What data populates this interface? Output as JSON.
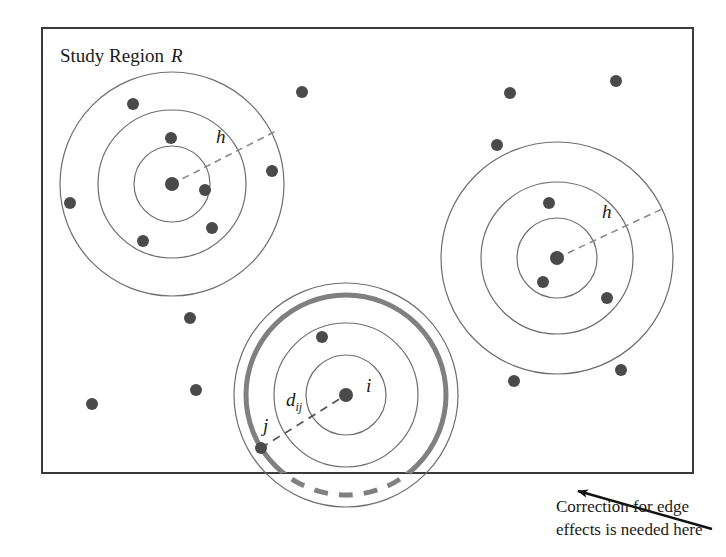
{
  "figure": {
    "width": 726,
    "height": 557,
    "background": "#ffffff",
    "study_region": {
      "label": "Study Region",
      "label_italic": "R",
      "x": 42,
      "y": 28,
      "width": 651,
      "height": 445,
      "stroke": "#3a3a3a"
    },
    "annotation": {
      "line1": "Correction for edge",
      "line2": "effects is needed here",
      "arrow_from_x": 712,
      "arrow_from_y": 529,
      "arrow_to_x": 578,
      "arrow_to_y": 491
    },
    "colors": {
      "point": "#4a4a4a",
      "thin_circle": "#6e6e6e",
      "thick_circle": "#808080",
      "dashed_radius": "#8a8a8a",
      "text": "#1a1a1a",
      "border": "#3a3a3a"
    },
    "clusters": [
      {
        "name": "top-left-cluster",
        "center_x": 172,
        "center_y": 184,
        "radii": [
          38,
          74,
          112
        ],
        "radius_label": "h",
        "radius_label_x": 216,
        "radius_label_y": 143,
        "dashed_angle_deg": -27
      },
      {
        "name": "right-cluster",
        "center_x": 557,
        "center_y": 258,
        "radii": [
          40,
          76,
          116
        ],
        "radius_label": "h",
        "radius_label_x": 602,
        "radius_label_y": 218,
        "dashed_angle_deg": -25
      },
      {
        "name": "bottom-edge-cluster",
        "center_x": 346,
        "center_y": 395,
        "radii": [
          40,
          72,
          112
        ],
        "highlight_radius": 100,
        "center_label": "i",
        "center_label_x": 366,
        "center_label_y": 392,
        "neighbor_label": "j",
        "neighbor_label_x": 263,
        "neighbor_label_y": 432,
        "distance_label": "d",
        "distance_label_sub": "ij",
        "distance_label_x": 286,
        "distance_label_y": 406
      }
    ],
    "points": [
      {
        "x": 172,
        "y": 184,
        "r": 7,
        "name": "point-cluster1-center"
      },
      {
        "x": 133,
        "y": 104,
        "r": 6,
        "name": "point"
      },
      {
        "x": 171,
        "y": 138,
        "r": 6,
        "name": "point"
      },
      {
        "x": 205,
        "y": 190,
        "r": 6,
        "name": "point"
      },
      {
        "x": 70,
        "y": 203,
        "r": 6,
        "name": "point"
      },
      {
        "x": 212,
        "y": 228,
        "r": 6,
        "name": "point"
      },
      {
        "x": 143,
        "y": 241,
        "r": 6,
        "name": "point"
      },
      {
        "x": 272,
        "y": 171,
        "r": 6,
        "name": "point"
      },
      {
        "x": 302,
        "y": 92,
        "r": 6,
        "name": "point"
      },
      {
        "x": 510,
        "y": 93,
        "r": 6,
        "name": "point"
      },
      {
        "x": 616,
        "y": 81,
        "r": 6,
        "name": "point"
      },
      {
        "x": 497,
        "y": 145,
        "r": 6,
        "name": "point"
      },
      {
        "x": 557,
        "y": 258,
        "r": 7,
        "name": "point-cluster2-center"
      },
      {
        "x": 549,
        "y": 203,
        "r": 6,
        "name": "point"
      },
      {
        "x": 543,
        "y": 282,
        "r": 6,
        "name": "point"
      },
      {
        "x": 607,
        "y": 298,
        "r": 6,
        "name": "point"
      },
      {
        "x": 514,
        "y": 381,
        "r": 6,
        "name": "point"
      },
      {
        "x": 621,
        "y": 370,
        "r": 6,
        "name": "point"
      },
      {
        "x": 190,
        "y": 318,
        "r": 6,
        "name": "point"
      },
      {
        "x": 196,
        "y": 390,
        "r": 6,
        "name": "point"
      },
      {
        "x": 92,
        "y": 404,
        "r": 6,
        "name": "point"
      },
      {
        "x": 346,
        "y": 395,
        "r": 7,
        "name": "point-i"
      },
      {
        "x": 322,
        "y": 337,
        "r": 6,
        "name": "point"
      },
      {
        "x": 261,
        "y": 448,
        "r": 6,
        "name": "point-j"
      }
    ]
  }
}
